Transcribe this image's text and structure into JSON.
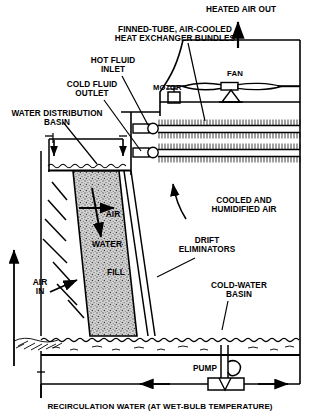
{
  "diagram": {
    "type": "process-schematic",
    "line_color": "#000000",
    "fill_color": "#c8c8c8",
    "background": "#ffffff"
  },
  "labels": {
    "heated_air_out": "HEATED AIR OUT",
    "heat_exchanger": "FINNED-TUBE, AIR-COOLED\nHEAT EXCHANGER BUNDLES",
    "hot_fluid_inlet": "HOT FLUID\nINLET",
    "cold_fluid_outlet": "COLD FLUID\nOUTLET",
    "water_distribution_basin": "WATER DISTRIBUTION\nBASIN",
    "motor": "MOTOR",
    "fan": "FAN",
    "cooled_humidified_air": "COOLED AND\nHUMIDIFIED AIR",
    "drift_eliminators": "DRIFT\nELIMINATORS",
    "air": "AIR",
    "water": "WATER",
    "fill": "FILL",
    "air_in": "AIR\nIN",
    "cold_water_basin": "COLD-WATER\nBASIN",
    "pump": "PUMP",
    "recirculation_water": "RECIRCULATION WATER (AT WET-BULB TEMPERATURE)"
  },
  "components": [
    {
      "name": "finned-tube-bundle-upper",
      "kind": "heat-exchanger-tube-row"
    },
    {
      "name": "finned-tube-bundle-lower",
      "kind": "heat-exchanger-tube-row"
    },
    {
      "name": "fan-blade-assembly",
      "kind": "fan"
    },
    {
      "name": "drive-motor",
      "kind": "motor"
    },
    {
      "name": "fill-pack",
      "kind": "stippled-trapezoid"
    },
    {
      "name": "drift-eliminator-panel",
      "kind": "louver"
    },
    {
      "name": "cold-water-basin",
      "kind": "water-reservoir"
    },
    {
      "name": "recirculation-pump",
      "kind": "pump"
    },
    {
      "name": "water-distribution-header",
      "kind": "pipe-manifold"
    }
  ],
  "flow_arrows": [
    {
      "name": "heated-air-out-arrow",
      "direction": "up"
    },
    {
      "name": "cooled-humidified-air-arrow",
      "direction": "up-left"
    },
    {
      "name": "air-crossflow-arrow",
      "direction": "right"
    },
    {
      "name": "water-downflow-arrow",
      "direction": "down"
    },
    {
      "name": "air-in-arrow",
      "direction": "up-right"
    },
    {
      "name": "air-in-riser-arrow",
      "direction": "up"
    },
    {
      "name": "recirculation-left-arrow",
      "direction": "left"
    },
    {
      "name": "recirculation-right-arrow",
      "direction": "right"
    },
    {
      "name": "distribution-spray-arrow-left",
      "direction": "down"
    },
    {
      "name": "distribution-spray-arrow-right",
      "direction": "down"
    }
  ]
}
